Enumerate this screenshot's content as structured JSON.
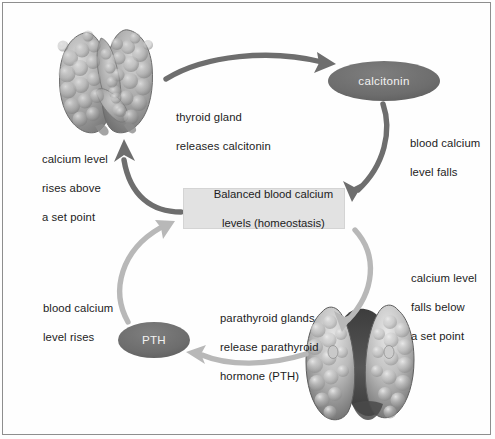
{
  "diagram": {
    "background_color": "#fefefe",
    "border_color": "#8e8e8e",
    "text_color": "#1c1c1c",
    "arrow_dark_color": "#6e6e6e",
    "arrow_light_color": "#b8b8b8",
    "ellipse_color": "#6f6f6f",
    "box_fill_color": "#e2e2e2"
  },
  "center_box": {
    "line1": "Balanced blood calcium",
    "line2": "levels (homeostasis)"
  },
  "hormones": [
    {
      "id": "calcitonin",
      "label": "calcitonin"
    },
    {
      "id": "pth",
      "label": "PTH"
    }
  ],
  "glands": [
    {
      "id": "thyroid",
      "name": "thyroid-gland-image"
    },
    {
      "id": "parathyroid",
      "name": "parathyroid-gland-image"
    }
  ],
  "labels": {
    "thyroid_release": {
      "line1": "thyroid gland",
      "line2": "releases calcitonin"
    },
    "calcium_rises_above": {
      "line1": "calcium level",
      "line2": "rises above",
      "line3": "a set point"
    },
    "blood_calcium_falls": {
      "line1": "blood calcium",
      "line2": "level falls"
    },
    "calcium_falls_below": {
      "line1": "calcium level",
      "line2": "falls below",
      "line3": "a set point"
    },
    "blood_calcium_rises": {
      "line1": "blood calcium",
      "line2": "level rises"
    },
    "parathyroid_release": {
      "line1": "parathyroid glands",
      "line2": "release parathyroid",
      "line3": "hormone (PTH)"
    }
  },
  "arrows": [
    {
      "id": "thyroid-to-calcitonin",
      "tone": "dark"
    },
    {
      "id": "calcitonin-to-box",
      "tone": "dark"
    },
    {
      "id": "box-to-thyroid",
      "tone": "dark"
    },
    {
      "id": "box-to-parathyroid",
      "tone": "light"
    },
    {
      "id": "parathyroid-to-pth",
      "tone": "light"
    },
    {
      "id": "pth-to-box",
      "tone": "light"
    }
  ]
}
